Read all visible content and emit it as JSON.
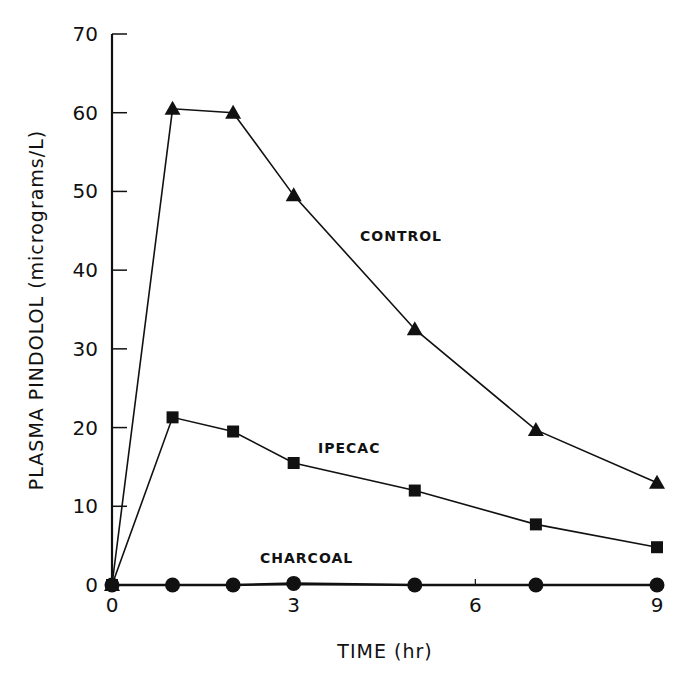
{
  "chart_data": {
    "type": "line",
    "title": "",
    "xlabel": "TIME (hr)",
    "ylabel": "PLASMA PINDOLOL (micrograms/L)",
    "xlim": [
      0,
      9
    ],
    "ylim": [
      0,
      70
    ],
    "x_ticks": [
      "0",
      "3",
      "6",
      "9"
    ],
    "y_ticks": [
      "0",
      "10",
      "20",
      "30",
      "40",
      "50",
      "60",
      "70"
    ],
    "grid": false,
    "legend": "inline labels",
    "series": [
      {
        "name": "CONTROL",
        "marker": "triangle",
        "x": [
          0,
          1,
          2,
          3,
          5,
          7,
          9
        ],
        "values": [
          0,
          60.5,
          60,
          49.5,
          32.5,
          19.7,
          13
        ]
      },
      {
        "name": "IPECAC",
        "marker": "square",
        "x": [
          0,
          1,
          2,
          3,
          5,
          7,
          9
        ],
        "values": [
          0,
          21.3,
          19.5,
          15.5,
          12,
          7.7,
          4.8
        ]
      },
      {
        "name": "CHARCOAL",
        "marker": "circle",
        "x": [
          0,
          1,
          2,
          3,
          5,
          7,
          9
        ],
        "values": [
          0,
          0,
          0,
          0.2,
          0,
          0,
          0
        ]
      }
    ]
  },
  "labels": {
    "xlabel": "TIME (hr)",
    "ylabel": "PLASMA PINDOLOL (micrograms/L)",
    "control": "CONTROL",
    "ipecac": "IPECAC",
    "charcoal": "CHARCOAL"
  },
  "colors": {
    "ink": "#111111",
    "background": "#ffffff"
  }
}
